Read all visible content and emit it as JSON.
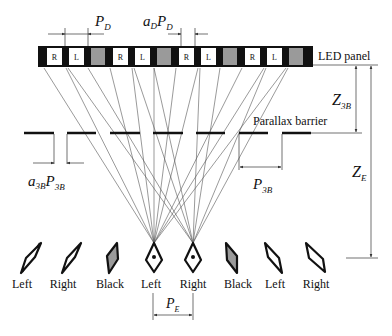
{
  "labels": {
    "led_panel": "LED panel",
    "parallax_barrier": "Parallax barrier",
    "pd_main": "P",
    "pd_sub": "D",
    "ad_main": "a",
    "ad_sub": "D",
    "adpd_main": "P",
    "adpd_sub": "D",
    "z3b_main": "Z",
    "z3b_sub": "3B",
    "ze_main": "Z",
    "ze_sub": "E",
    "a3b_main": "a",
    "a3b_sub": "3B",
    "a3bp_main": "P",
    "a3bp_sub": "3B",
    "p3b_main": "P",
    "p3b_sub": "3B",
    "pe_main": "P",
    "pe_sub": "E"
  },
  "led_cells": [
    {
      "type": "black"
    },
    {
      "type": "R",
      "text": "R"
    },
    {
      "type": "black"
    },
    {
      "type": "L",
      "text": "L"
    },
    {
      "type": "black"
    },
    {
      "type": "gray"
    },
    {
      "type": "black"
    },
    {
      "type": "R",
      "text": "R"
    },
    {
      "type": "black"
    },
    {
      "type": "L",
      "text": "L"
    },
    {
      "type": "black"
    },
    {
      "type": "gray"
    },
    {
      "type": "black"
    },
    {
      "type": "R",
      "text": "R"
    },
    {
      "type": "black"
    },
    {
      "type": "L",
      "text": "L"
    },
    {
      "type": "black"
    },
    {
      "type": "gray"
    },
    {
      "type": "black"
    },
    {
      "type": "R",
      "text": "R"
    },
    {
      "type": "black"
    },
    {
      "type": "L",
      "text": "L"
    },
    {
      "type": "black"
    },
    {
      "type": "gray"
    },
    {
      "type": "black"
    }
  ],
  "viewing_zones": [
    {
      "label": "Left",
      "fill": "white"
    },
    {
      "label": "Right",
      "fill": "white"
    },
    {
      "label": "Black",
      "fill": "gray"
    },
    {
      "label": "Left",
      "fill": "white",
      "eye": true
    },
    {
      "label": "Right",
      "fill": "white",
      "eye": true
    },
    {
      "label": "Black",
      "fill": "gray"
    },
    {
      "label": "Left",
      "fill": "white"
    },
    {
      "label": "Right",
      "fill": "white"
    }
  ],
  "colors": {
    "black": "#111111",
    "gray": "#9a9a9a",
    "line": "#555555"
  }
}
